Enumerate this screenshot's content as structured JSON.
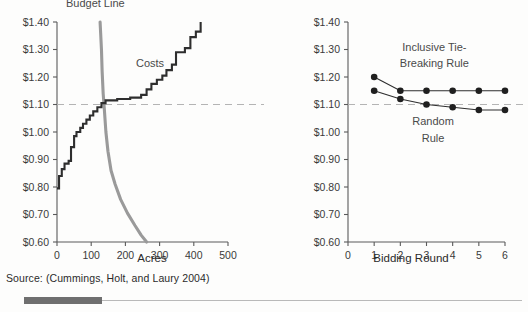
{
  "source_note": "Source: (Cummings, Holt, and Laury 2004)",
  "colors": {
    "costs": "#2e2e2e",
    "budget": "#9a9a9a",
    "reference": "#b4b4b4",
    "axis": "#5a5a5a",
    "footer_tab": "#6f6f6f"
  },
  "chart_data": [
    {
      "type": "line",
      "id": "left-panel",
      "title": "",
      "xlabel": "Acres",
      "ylabel": "",
      "xlim": [
        0,
        500
      ],
      "ylim": [
        0.6,
        1.4
      ],
      "xticks": [
        0,
        100,
        200,
        300,
        400,
        500
      ],
      "xticklabels": [
        "0",
        "100",
        "200",
        "300",
        "400",
        "500"
      ],
      "yticks": [
        0.6,
        0.7,
        0.8,
        0.9,
        1.0,
        1.1,
        1.2,
        1.3,
        1.4
      ],
      "yticklabels": [
        "$0.60",
        "$0.70",
        "$0.80",
        "$0.90",
        "$1.00",
        "$1.10",
        "$1.20",
        "$1.30",
        "$1.40"
      ],
      "grid": false,
      "legend_position": "inline-annotation",
      "reference_lines": [
        {
          "axis": "y",
          "value": 1.1,
          "style": "dashed",
          "label": ""
        }
      ],
      "annotations": [
        {
          "text": "Budget Line",
          "x": 112,
          "y": 1.455
        },
        {
          "text": "Costs",
          "x": 272,
          "y": 1.235
        }
      ],
      "series": [
        {
          "name": "Costs",
          "style": "step",
          "color": "#2e2e2e",
          "points": [
            {
              "x": 0,
              "y": 0.795
            },
            {
              "x": 6,
              "y": 0.84
            },
            {
              "x": 14,
              "y": 0.865
            },
            {
              "x": 22,
              "y": 0.885
            },
            {
              "x": 34,
              "y": 0.895
            },
            {
              "x": 41,
              "y": 0.945
            },
            {
              "x": 50,
              "y": 0.985
            },
            {
              "x": 57,
              "y": 1.0
            },
            {
              "x": 68,
              "y": 1.015
            },
            {
              "x": 76,
              "y": 1.03
            },
            {
              "x": 86,
              "y": 1.045
            },
            {
              "x": 96,
              "y": 1.06
            },
            {
              "x": 106,
              "y": 1.075
            },
            {
              "x": 118,
              "y": 1.09
            },
            {
              "x": 130,
              "y": 1.105
            },
            {
              "x": 142,
              "y": 1.115
            },
            {
              "x": 176,
              "y": 1.12
            },
            {
              "x": 214,
              "y": 1.125
            },
            {
              "x": 246,
              "y": 1.135
            },
            {
              "x": 262,
              "y": 1.155
            },
            {
              "x": 276,
              "y": 1.175
            },
            {
              "x": 292,
              "y": 1.19
            },
            {
              "x": 308,
              "y": 1.205
            },
            {
              "x": 320,
              "y": 1.225
            },
            {
              "x": 336,
              "y": 1.245
            },
            {
              "x": 348,
              "y": 1.29
            },
            {
              "x": 374,
              "y": 1.305
            },
            {
              "x": 390,
              "y": 1.345
            },
            {
              "x": 406,
              "y": 1.365
            },
            {
              "x": 420,
              "y": 1.4
            }
          ]
        },
        {
          "name": "Budget Line",
          "style": "curve",
          "color": "#9a9a9a",
          "points": [
            {
              "x": 126,
              "y": 1.4
            },
            {
              "x": 130,
              "y": 1.3
            },
            {
              "x": 132,
              "y": 1.22
            },
            {
              "x": 135,
              "y": 1.14
            },
            {
              "x": 138,
              "y": 1.09
            },
            {
              "x": 143,
              "y": 1.0
            },
            {
              "x": 149,
              "y": 0.93
            },
            {
              "x": 158,
              "y": 0.86
            },
            {
              "x": 170,
              "y": 0.81
            },
            {
              "x": 186,
              "y": 0.755
            },
            {
              "x": 206,
              "y": 0.705
            },
            {
              "x": 228,
              "y": 0.66
            },
            {
              "x": 246,
              "y": 0.625
            },
            {
              "x": 262,
              "y": 0.6
            }
          ]
        }
      ]
    },
    {
      "type": "line",
      "id": "right-panel",
      "title": "",
      "xlabel": "Bidding Round",
      "ylabel": "",
      "xlim": [
        0,
        6
      ],
      "ylim": [
        0.6,
        1.4
      ],
      "xticks": [
        0,
        1,
        2,
        3,
        4,
        5,
        6
      ],
      "xticklabels": [
        "0",
        "1",
        "2",
        "3",
        "4",
        "5",
        "6"
      ],
      "yticks": [
        0.6,
        0.7,
        0.8,
        0.9,
        1.0,
        1.1,
        1.2,
        1.3,
        1.4
      ],
      "yticklabels": [
        "$0.60",
        "$0.70",
        "$0.80",
        "$0.90",
        "$1.00",
        "$1.10",
        "$1.20",
        "$1.30",
        "$1.40"
      ],
      "grid": false,
      "legend_position": "inline-annotation",
      "reference_lines": [
        {
          "axis": "y",
          "value": 1.1,
          "style": "dashed",
          "label": ""
        }
      ],
      "annotations": [
        {
          "text": "Inclusive Tie-",
          "x": 3.3,
          "y": 1.295
        },
        {
          "text": "Breaking Rule",
          "x": 3.3,
          "y": 1.235
        },
        {
          "text": "Random",
          "x": 3.25,
          "y": 1.025
        },
        {
          "text": "Rule",
          "x": 3.25,
          "y": 0.965
        }
      ],
      "categories": [
        1,
        2,
        3,
        4,
        5,
        6
      ],
      "series": [
        {
          "name": "Inclusive Tie-Breaking Rule",
          "color": "#1f1f1f",
          "markers": true,
          "values": [
            1.2,
            1.15,
            1.15,
            1.15,
            1.15,
            1.15
          ]
        },
        {
          "name": "Random Rule",
          "color": "#1f1f1f",
          "markers": true,
          "values": [
            1.15,
            1.12,
            1.1,
            1.09,
            1.08,
            1.08
          ]
        }
      ]
    }
  ]
}
